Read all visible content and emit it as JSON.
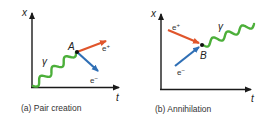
{
  "panels": [
    {
      "id": "a",
      "caption": "(a) Pair creation",
      "axis_x_label": "x",
      "axis_t_label": "t",
      "event_label": "A",
      "photon_label": "γ",
      "positron_label": "e",
      "positron_sup": "+",
      "electron_label": "e",
      "electron_sup": "−"
    },
    {
      "id": "b",
      "caption": "(b) Annihilation",
      "axis_x_label": "x",
      "axis_t_label": "t",
      "event_label": "B",
      "photon_label": "γ",
      "positron_label": "e",
      "positron_sup": "+",
      "electron_label": "e",
      "electron_sup": "−"
    }
  ],
  "colors": {
    "axis": "#1a1a1a",
    "photon": "#4caf3a",
    "positron": "#e0552b",
    "electron": "#2f6fb5",
    "vertex": "#111111"
  }
}
